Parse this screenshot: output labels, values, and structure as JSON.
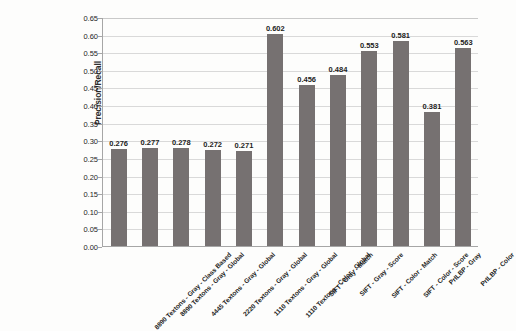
{
  "chart_data": {
    "type": "bar",
    "title": "",
    "xlabel": "",
    "ylabel": "Precision/Recall",
    "ylim": [
      0.0,
      0.65
    ],
    "ytick_step": 0.05,
    "grid": true,
    "legend": "none",
    "bar_color": "#767171",
    "categories": [
      "8890 Textons - Gray - Class Based",
      "8890 Textons - Gray - Global",
      "4445 Textons - Gray - Global",
      "2220 Textons - Gray - Global",
      "1110 Textons - Gray - Global",
      "1110 Textons - Color - Global",
      "SIFT - Gray - Match",
      "SIFT - Gray - Score",
      "SIFT - Color - Match",
      "SIFT - Color - Score",
      "PrILBP - Gray",
      "PrILBP - Color"
    ],
    "values": [
      0.276,
      0.277,
      0.278,
      0.272,
      0.271,
      0.602,
      0.456,
      0.484,
      0.553,
      0.581,
      0.381,
      0.563
    ],
    "value_labels": [
      "0.276",
      "0.277",
      "0.278",
      "0.272",
      "0.271",
      "0.602",
      "0.456",
      "0.484",
      "0.553",
      "0.581",
      "0.381",
      "0.563"
    ],
    "ytick_labels": [
      "0.00",
      "0.05",
      "0.10",
      "0.15",
      "0.20",
      "0.25",
      "0.30",
      "0.35",
      "0.40",
      "0.45",
      "0.50",
      "0.55",
      "0.60",
      "0.65"
    ],
    "ytick_values": [
      0.0,
      0.05,
      0.1,
      0.15,
      0.2,
      0.25,
      0.3,
      0.35,
      0.4,
      0.45,
      0.5,
      0.55,
      0.6,
      0.65
    ]
  }
}
